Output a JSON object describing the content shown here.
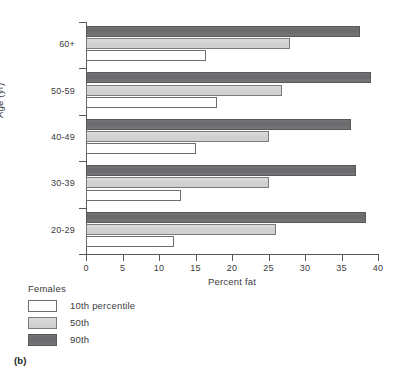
{
  "panel_label": "(b)",
  "chart_data": {
    "type": "bar",
    "orientation": "horizontal",
    "title": "",
    "xlabel": "Percent fat",
    "ylabel": "Age (yr)",
    "xlim": [
      0,
      40
    ],
    "xticks": [
      0,
      5,
      10,
      15,
      20,
      25,
      30,
      35,
      40
    ],
    "xtick_labels": [
      "0",
      "5",
      "10",
      "15",
      "20",
      "25",
      "30",
      "35",
      "40"
    ],
    "grid": false,
    "categories": [
      "20-29",
      "30-39",
      "40-49",
      "50-59",
      "60+"
    ],
    "category_display_order_top_to_bottom": [
      "60+",
      "50-59",
      "40-49",
      "30-39",
      "20-29"
    ],
    "legend_title": "Females",
    "legend_position": "below-left",
    "series": [
      {
        "name": "10th percentile",
        "color": "#ffffff",
        "border_color": "#6d6e71",
        "values": [
          12,
          13,
          15,
          18,
          16.5
        ]
      },
      {
        "name": "50th",
        "color": "#d2d2d2",
        "border_color": "#7a7b7d",
        "values": [
          26,
          25,
          25,
          26.8,
          28
        ]
      },
      {
        "name": "90th",
        "color": "#6a6a6c",
        "border_color": "#58585a",
        "values": [
          38.3,
          37,
          36.3,
          39,
          37.6
        ]
      }
    ]
  }
}
